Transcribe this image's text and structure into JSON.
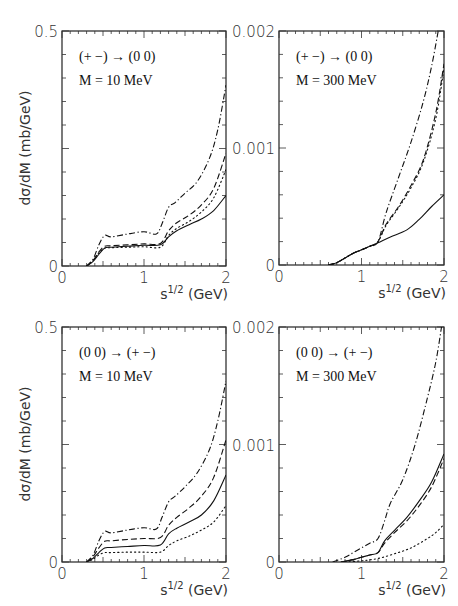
{
  "figure": {
    "ylabel": "dσ/dM   (mb/GeV)",
    "xlabel_base": "s",
    "xlabel_sup": "1/2",
    "xlabel_unit": " (GeV)"
  },
  "chart_data": [
    {
      "type": "line",
      "panel": "top-left",
      "process": "(+ −) → (0 0)",
      "mass_label": "M = 10 MeV",
      "xlabel": "s^1/2 (GeV)",
      "ylabel": "dσ/dM (mb/GeV)",
      "xlim": [
        0,
        2
      ],
      "ylim": [
        0,
        0.5
      ],
      "xticks": [
        "0",
        "1",
        "2"
      ],
      "yticks": [
        "0",
        "0.5"
      ],
      "series": [
        {
          "name": "solid",
          "style": "solid",
          "x": [
            0.3,
            0.38,
            0.45,
            0.52,
            0.6,
            0.8,
            1.0,
            1.2,
            1.3,
            1.4,
            1.55,
            1.7,
            1.85,
            2.0
          ],
          "y": [
            0,
            0.01,
            0.025,
            0.038,
            0.04,
            0.042,
            0.044,
            0.045,
            0.062,
            0.075,
            0.088,
            0.1,
            0.118,
            0.15
          ]
        },
        {
          "name": "dashed",
          "style": "dashed",
          "x": [
            0.3,
            0.38,
            0.45,
            0.52,
            0.6,
            0.8,
            1.0,
            1.2,
            1.3,
            1.4,
            1.55,
            1.7,
            1.85,
            2.0
          ],
          "y": [
            0,
            0.012,
            0.03,
            0.042,
            0.043,
            0.045,
            0.047,
            0.048,
            0.075,
            0.092,
            0.108,
            0.13,
            0.165,
            0.24
          ]
        },
        {
          "name": "dotted",
          "style": "dotted",
          "x": [
            0.3,
            0.38,
            0.45,
            0.52,
            0.6,
            0.8,
            1.0,
            1.2,
            1.3,
            1.4,
            1.55,
            1.7,
            1.85,
            2.0
          ],
          "y": [
            0,
            0.012,
            0.028,
            0.038,
            0.039,
            0.04,
            0.041,
            0.04,
            0.065,
            0.08,
            0.095,
            0.115,
            0.145,
            0.205
          ]
        },
        {
          "name": "dash-dot",
          "style": "dashdot",
          "x": [
            0.3,
            0.38,
            0.45,
            0.52,
            0.6,
            0.8,
            1.0,
            1.15,
            1.22,
            1.3,
            1.38,
            1.5,
            1.65,
            1.8,
            1.9,
            2.0
          ],
          "y": [
            0,
            0.015,
            0.045,
            0.065,
            0.062,
            0.068,
            0.073,
            0.068,
            0.09,
            0.125,
            0.135,
            0.155,
            0.18,
            0.23,
            0.29,
            0.385
          ]
        }
      ]
    },
    {
      "type": "line",
      "panel": "top-right",
      "process": "(+ −) → (0 0)",
      "mass_label": "M = 300 MeV",
      "xlabel": "s^1/2 (GeV)",
      "ylabel": "dσ/dM (mb/GeV)",
      "xlim": [
        0,
        2
      ],
      "ylim": [
        0,
        0.002
      ],
      "xticks": [
        "0",
        "1",
        "2"
      ],
      "yticks": [
        "0",
        "0.001",
        "0.002"
      ],
      "series": [
        {
          "name": "solid",
          "style": "solid",
          "x": [
            0.6,
            0.7,
            0.8,
            0.9,
            1.0,
            1.1,
            1.2,
            1.35,
            1.55,
            1.7,
            1.85,
            2.0
          ],
          "y": [
            0,
            2e-05,
            6e-05,
            0.0001,
            0.00013,
            0.00016,
            0.00019,
            0.00024,
            0.0003,
            0.00039,
            0.0005,
            0.0006
          ]
        },
        {
          "name": "dashed",
          "style": "dashed",
          "x": [
            0.6,
            0.7,
            0.8,
            0.9,
            1.0,
            1.1,
            1.2,
            1.3,
            1.45,
            1.6,
            1.75,
            1.9,
            2.0
          ],
          "y": [
            0,
            2e-05,
            6e-05,
            0.0001,
            0.00013,
            0.00016,
            0.0002,
            0.00035,
            0.0005,
            0.00068,
            0.0009,
            0.0013,
            0.00172
          ]
        },
        {
          "name": "dotted",
          "style": "dotted",
          "x": [
            0.6,
            0.7,
            0.8,
            0.9,
            1.0,
            1.1,
            1.2,
            1.3,
            1.45,
            1.6,
            1.75,
            1.9,
            2.0
          ],
          "y": [
            0,
            2e-05,
            6e-05,
            0.0001,
            0.00013,
            0.00016,
            0.0002,
            0.00034,
            0.00049,
            0.00066,
            0.00088,
            0.00125,
            0.00168
          ]
        },
        {
          "name": "dash-dot",
          "style": "dashdot",
          "x": [
            0.6,
            0.7,
            0.8,
            0.9,
            1.0,
            1.1,
            1.2,
            1.3,
            1.45,
            1.6,
            1.75,
            1.85,
            1.93
          ],
          "y": [
            0,
            2e-05,
            6e-05,
            0.0001,
            0.00013,
            0.00016,
            0.0002,
            0.00045,
            0.00075,
            0.00105,
            0.0014,
            0.0017,
            0.002
          ]
        }
      ]
    },
    {
      "type": "line",
      "panel": "bottom-left",
      "process": "(0 0) → (+ −)",
      "mass_label": "M = 10 MeV",
      "xlabel": "s^1/2 (GeV)",
      "ylabel": "dσ/dM (mb/GeV)",
      "xlim": [
        0,
        2
      ],
      "ylim": [
        0,
        0.5
      ],
      "xticks": [
        "0",
        "1",
        "2"
      ],
      "yticks": [
        "0",
        "0.5"
      ],
      "series": [
        {
          "name": "solid",
          "style": "solid",
          "x": [
            0.3,
            0.38,
            0.45,
            0.52,
            0.6,
            0.8,
            1.0,
            1.2,
            1.3,
            1.4,
            1.55,
            1.7,
            1.85,
            2.0
          ],
          "y": [
            0,
            0.008,
            0.02,
            0.03,
            0.031,
            0.033,
            0.035,
            0.036,
            0.06,
            0.072,
            0.085,
            0.1,
            0.13,
            0.185
          ]
        },
        {
          "name": "dashed",
          "style": "dashed",
          "x": [
            0.3,
            0.38,
            0.45,
            0.52,
            0.6,
            0.8,
            1.0,
            1.2,
            1.3,
            1.4,
            1.55,
            1.7,
            1.85,
            2.0
          ],
          "y": [
            0,
            0.012,
            0.03,
            0.044,
            0.045,
            0.048,
            0.05,
            0.052,
            0.078,
            0.095,
            0.115,
            0.14,
            0.18,
            0.26
          ]
        },
        {
          "name": "dotted",
          "style": "dotted",
          "x": [
            0.3,
            0.38,
            0.45,
            0.52,
            0.6,
            0.8,
            1.0,
            1.2,
            1.3,
            1.4,
            1.55,
            1.7,
            1.85,
            2.0
          ],
          "y": [
            0,
            0.006,
            0.015,
            0.02,
            0.02,
            0.021,
            0.021,
            0.021,
            0.035,
            0.045,
            0.055,
            0.068,
            0.085,
            0.12
          ]
        },
        {
          "name": "dash-dot",
          "style": "dashdot",
          "x": [
            0.3,
            0.38,
            0.45,
            0.52,
            0.6,
            0.8,
            1.0,
            1.15,
            1.22,
            1.3,
            1.38,
            1.5,
            1.65,
            1.8,
            1.9,
            2.0
          ],
          "y": [
            0,
            0.015,
            0.045,
            0.065,
            0.062,
            0.068,
            0.073,
            0.07,
            0.095,
            0.128,
            0.14,
            0.16,
            0.19,
            0.24,
            0.3,
            0.385
          ]
        }
      ]
    },
    {
      "type": "line",
      "panel": "bottom-right",
      "process": "(0 0) → (+ −)",
      "mass_label": "M = 300 MeV",
      "xlabel": "s^1/2 (GeV)",
      "ylabel": "dσ/dM (mb/GeV)",
      "xlim": [
        0,
        2
      ],
      "ylim": [
        0,
        0.002
      ],
      "xticks": [
        "0",
        "1",
        "2"
      ],
      "yticks": [
        "0",
        "0.001",
        "0.002"
      ],
      "series": [
        {
          "name": "solid",
          "style": "solid",
          "x": [
            0.75,
            0.9,
            1.0,
            1.1,
            1.2,
            1.28,
            1.4,
            1.55,
            1.7,
            1.85,
            2.0
          ],
          "y": [
            0,
            2e-05,
            4e-05,
            6e-05,
            8e-05,
            0.00018,
            0.00027,
            0.00038,
            0.00052,
            0.00068,
            0.00092
          ]
        },
        {
          "name": "dashed",
          "style": "dashed",
          "x": [
            0.75,
            0.9,
            1.0,
            1.1,
            1.2,
            1.28,
            1.4,
            1.55,
            1.7,
            1.85,
            2.0
          ],
          "y": [
            0,
            2e-05,
            4e-05,
            6e-05,
            8e-05,
            0.00016,
            0.00025,
            0.00035,
            0.00048,
            0.00064,
            0.00088
          ]
        },
        {
          "name": "dotted",
          "style": "dotted",
          "x": [
            0.8,
            1.0,
            1.2,
            1.4,
            1.6,
            1.8,
            1.9,
            2.0
          ],
          "y": [
            0,
            1e-05,
            3e-05,
            7e-05,
            0.00012,
            0.0002,
            0.00025,
            0.00032
          ]
        },
        {
          "name": "dash-dot",
          "style": "dashdot",
          "x": [
            0.65,
            0.8,
            0.9,
            1.0,
            1.1,
            1.2,
            1.28,
            1.35,
            1.5,
            1.65,
            1.8,
            1.9,
            1.97
          ],
          "y": [
            0,
            4e-05,
            8e-05,
            0.00012,
            0.00016,
            0.0002,
            0.00035,
            0.0005,
            0.0007,
            0.001,
            0.0014,
            0.0017,
            0.002
          ]
        }
      ]
    }
  ]
}
